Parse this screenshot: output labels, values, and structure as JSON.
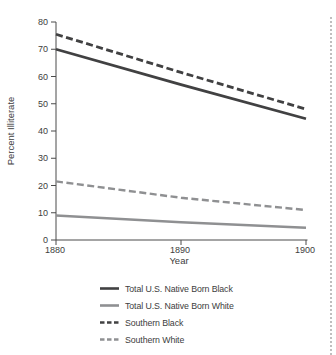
{
  "chart_data": {
    "type": "line",
    "x": [
      1880,
      1890,
      1900
    ],
    "xlabel": "Year",
    "ylabel": "Percent Illiterate",
    "ylim": [
      0,
      80
    ],
    "ytick_step": 10,
    "grid": false,
    "legend_position": "below-left",
    "series": [
      {
        "name": "Total U.S. Native Born Black",
        "style": "solid",
        "color_key": "dark",
        "values": [
          70,
          57,
          44.5
        ]
      },
      {
        "name": "Total U.S. Native Born White",
        "style": "solid",
        "color_key": "gray",
        "values": [
          9,
          6.5,
          4.5
        ]
      },
      {
        "name": "Southern Black",
        "style": "dashed",
        "color_key": "dark",
        "values": [
          75.5,
          61.5,
          48
        ]
      },
      {
        "name": "Southern White",
        "style": "dashed",
        "color_key": "gray",
        "values": [
          21.5,
          15.5,
          11
        ]
      }
    ]
  },
  "colors": {
    "dark": "#414142",
    "gray": "#8f9092",
    "axis": "#4b4b4b",
    "text": "#3d3d3d",
    "page_edge": "#bfbfbf"
  }
}
